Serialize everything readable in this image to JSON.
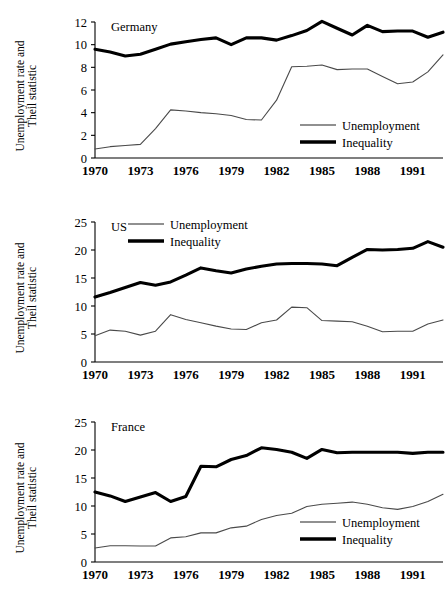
{
  "figure": {
    "width": 448,
    "height": 603,
    "background": "#ffffff",
    "ylabel_line1": "Unemployment rate and",
    "ylabel_line2": "Theil statistic",
    "legend": {
      "unemployment_label": "Unemployment",
      "inequality_label": "Inequality"
    },
    "colors": {
      "unemployment": "#4a4a4a",
      "inequality": "#000000",
      "axis": "#000000",
      "background": "#ffffff"
    }
  },
  "chart_data": [
    {
      "type": "line",
      "title": "Germany",
      "xlabel": "",
      "ylabel": "Unemployment rate and Theil statistic",
      "x": [
        1970,
        1971,
        1972,
        1973,
        1974,
        1975,
        1976,
        1977,
        1978,
        1979,
        1980,
        1981,
        1982,
        1983,
        1984,
        1985,
        1986,
        1987,
        1988,
        1989,
        1990,
        1991,
        1992,
        1993
      ],
      "xlim": [
        1970,
        1993
      ],
      "ylim": [
        0,
        12
      ],
      "xticks": [
        1970,
        1973,
        1976,
        1979,
        1982,
        1985,
        1988,
        1991
      ],
      "yticks": [
        0,
        2,
        4,
        6,
        8,
        10,
        12
      ],
      "grid": false,
      "legend_position": "lower-right",
      "series": [
        {
          "name": "Unemployment",
          "style": "thin",
          "values": [
            0.8,
            1.0,
            1.1,
            1.2,
            2.6,
            4.25,
            4.15,
            4.0,
            3.9,
            3.75,
            3.4,
            3.35,
            5.1,
            8.05,
            8.1,
            8.2,
            7.8,
            7.85,
            7.85,
            7.2,
            6.55,
            6.7,
            7.6,
            9.1
          ]
        },
        {
          "name": "Inequality",
          "style": "thick",
          "values": [
            9.6,
            9.35,
            9.0,
            9.15,
            9.6,
            10.05,
            10.25,
            10.45,
            10.6,
            10.0,
            10.6,
            10.6,
            10.4,
            10.8,
            11.25,
            12.05,
            11.45,
            10.85,
            11.7,
            11.15,
            11.2,
            11.2,
            10.65,
            11.1
          ]
        }
      ]
    },
    {
      "type": "line",
      "title": "US",
      "xlabel": "",
      "ylabel": "Unemployment rate and Theil statistic",
      "x": [
        1970,
        1971,
        1972,
        1973,
        1974,
        1975,
        1976,
        1977,
        1978,
        1979,
        1980,
        1981,
        1982,
        1983,
        1984,
        1985,
        1986,
        1987,
        1988,
        1989,
        1990,
        1991,
        1992,
        1993
      ],
      "xlim": [
        1970,
        1993
      ],
      "ylim": [
        0,
        25
      ],
      "xticks": [
        1970,
        1973,
        1976,
        1979,
        1982,
        1985,
        1988,
        1991
      ],
      "yticks": [
        0,
        5,
        10,
        15,
        20,
        25
      ],
      "grid": false,
      "legend_position": "upper-left",
      "series": [
        {
          "name": "Unemployment",
          "style": "thin",
          "values": [
            4.7,
            5.7,
            5.5,
            4.8,
            5.5,
            8.45,
            7.6,
            7.0,
            6.4,
            5.9,
            5.8,
            7.0,
            7.5,
            9.8,
            9.7,
            7.4,
            7.3,
            7.2,
            6.4,
            5.4,
            5.5,
            5.5,
            6.8,
            7.5
          ]
        },
        {
          "name": "Inequality",
          "style": "thick",
          "values": [
            11.6,
            12.4,
            13.3,
            14.2,
            13.7,
            14.3,
            15.5,
            16.8,
            16.3,
            15.9,
            16.6,
            17.1,
            17.5,
            17.6,
            17.6,
            17.5,
            17.2,
            18.7,
            20.1,
            20.0,
            20.1,
            20.3,
            21.5,
            20.5
          ]
        }
      ]
    },
    {
      "type": "line",
      "title": "France",
      "xlabel": "",
      "ylabel": "Unemployment rate and Theil statistic",
      "x": [
        1970,
        1971,
        1972,
        1973,
        1974,
        1975,
        1976,
        1977,
        1978,
        1979,
        1980,
        1981,
        1982,
        1983,
        1984,
        1985,
        1986,
        1987,
        1988,
        1989,
        1990,
        1991,
        1992,
        1993
      ],
      "xlim": [
        1970,
        1993
      ],
      "ylim": [
        0,
        25
      ],
      "xticks": [
        1970,
        1973,
        1976,
        1979,
        1982,
        1985,
        1988,
        1991
      ],
      "yticks": [
        0,
        5,
        10,
        15,
        20,
        25
      ],
      "grid": false,
      "legend_position": "lower-right",
      "series": [
        {
          "name": "Unemployment",
          "style": "thin",
          "values": [
            2.5,
            2.9,
            2.9,
            2.85,
            2.85,
            4.3,
            4.5,
            5.2,
            5.2,
            6.1,
            6.4,
            7.6,
            8.3,
            8.7,
            9.9,
            10.3,
            10.5,
            10.7,
            10.3,
            9.7,
            9.4,
            9.9,
            10.8,
            12.1
          ]
        },
        {
          "name": "Inequality",
          "style": "thick",
          "values": [
            12.5,
            11.8,
            10.8,
            11.6,
            12.4,
            10.8,
            11.7,
            17.1,
            17.0,
            18.3,
            19.0,
            20.4,
            20.1,
            19.6,
            18.5,
            20.1,
            19.5,
            19.6,
            19.6,
            19.6,
            19.6,
            19.4,
            19.6,
            19.6
          ]
        }
      ]
    }
  ]
}
